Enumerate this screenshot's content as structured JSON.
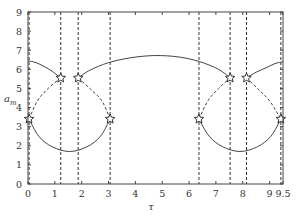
{
  "chart_data": {
    "type": "line",
    "title": "",
    "xlabel": "τ",
    "ylabel": "a_m",
    "xlim": [
      0,
      9.5
    ],
    "ylim": [
      0,
      9
    ],
    "xticks": [
      0,
      1,
      2,
      3,
      4,
      5,
      6,
      7,
      8,
      9,
      9.5
    ],
    "xtick_labels": [
      "0",
      "1",
      "2",
      "3",
      "4",
      "5",
      "6",
      "7",
      "8",
      "9",
      "9.5"
    ],
    "yticks": [
      0,
      1,
      2,
      3,
      4,
      5,
      6,
      7,
      8,
      9
    ],
    "ytick_labels": [
      "0",
      "1",
      "2",
      "3",
      "4",
      "5",
      "6",
      "7",
      "8",
      "9"
    ],
    "grid": false,
    "legend": null,
    "vertical_dashed_lines": [
      0.04,
      1.22,
      1.87,
      3.06,
      6.37,
      7.53,
      8.14,
      9.42
    ],
    "star_markers": [
      {
        "x": 0.04,
        "y": 3.4
      },
      {
        "x": 1.22,
        "y": 5.55
      },
      {
        "x": 1.87,
        "y": 5.55
      },
      {
        "x": 3.06,
        "y": 3.4
      },
      {
        "x": 6.37,
        "y": 3.4
      },
      {
        "x": 7.53,
        "y": 5.55
      },
      {
        "x": 8.14,
        "y": 5.55
      },
      {
        "x": 9.42,
        "y": 3.4
      }
    ],
    "series": [
      {
        "name": "upper-left-solid",
        "style": "solid",
        "x": [
          0,
          0.3,
          0.6,
          0.9,
          1.22
        ],
        "y": [
          6.45,
          6.35,
          6.15,
          5.9,
          5.55
        ]
      },
      {
        "name": "upper-middle-solid",
        "style": "solid",
        "x": [
          1.87,
          2.3,
          3.0,
          3.8,
          4.7,
          5.6,
          6.4,
          7.1,
          7.53
        ],
        "y": [
          5.55,
          5.95,
          6.35,
          6.6,
          6.72,
          6.65,
          6.4,
          6.0,
          5.55
        ]
      },
      {
        "name": "upper-right-solid",
        "style": "solid",
        "x": [
          8.14,
          8.5,
          8.9,
          9.2,
          9.5
        ],
        "y": [
          5.55,
          5.85,
          6.1,
          6.3,
          6.4
        ]
      },
      {
        "name": "lower-left-solid",
        "style": "solid",
        "x": [
          0.04,
          0.4,
          0.9,
          1.55,
          2.2,
          2.7,
          3.06
        ],
        "y": [
          3.4,
          2.5,
          1.95,
          1.7,
          1.95,
          2.5,
          3.4
        ]
      },
      {
        "name": "lower-right-solid",
        "style": "solid",
        "x": [
          6.37,
          6.75,
          7.25,
          7.9,
          8.55,
          9.05,
          9.42
        ],
        "y": [
          3.4,
          2.5,
          1.95,
          1.7,
          1.95,
          2.5,
          3.4
        ]
      },
      {
        "name": "left-dashed-arc-1",
        "style": "dashed",
        "x": [
          0.04,
          0.35,
          0.75,
          1.22
        ],
        "y": [
          3.4,
          4.35,
          5.0,
          5.55
        ]
      },
      {
        "name": "left-dashed-arc-2",
        "style": "dashed",
        "x": [
          1.87,
          2.3,
          2.75,
          3.06
        ],
        "y": [
          5.55,
          5.0,
          4.35,
          3.4
        ]
      },
      {
        "name": "right-dashed-arc-1",
        "style": "dashed",
        "x": [
          6.37,
          6.7,
          7.1,
          7.53
        ],
        "y": [
          3.4,
          4.35,
          5.0,
          5.55
        ]
      },
      {
        "name": "right-dashed-arc-2",
        "style": "dashed",
        "x": [
          8.14,
          8.55,
          9.0,
          9.42
        ],
        "y": [
          5.55,
          5.0,
          4.35,
          3.4
        ]
      }
    ]
  }
}
